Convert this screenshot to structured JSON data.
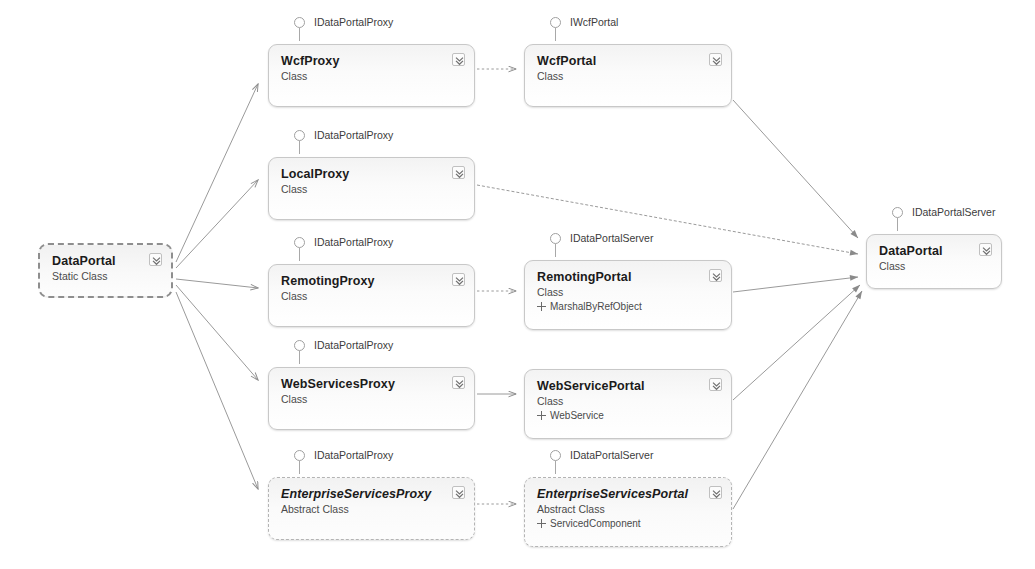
{
  "diagram": {
    "colors": {
      "node_border": "#c8c8c8",
      "node_fill": "#f6f6f6",
      "text": "#1b1b1b",
      "subtext": "#4a4a4a",
      "connector": "#9a9a9a"
    },
    "nodes": [
      {
        "id": "dataportal-client",
        "title": "DataPortal",
        "kind": "Static Class",
        "base": null,
        "interface": null,
        "style": "dashed-strong",
        "italic": false,
        "x": 38,
        "y": 243,
        "w": 135,
        "h": 55
      },
      {
        "id": "wcf-proxy",
        "title": "WcfProxy",
        "kind": "Class",
        "base": null,
        "interface": "IDataPortalProxy",
        "style": "solid",
        "italic": false,
        "x": 268,
        "y": 44,
        "w": 207,
        "h": 63
      },
      {
        "id": "local-proxy",
        "title": "LocalProxy",
        "kind": "Class",
        "base": null,
        "interface": "IDataPortalProxy",
        "style": "solid",
        "italic": false,
        "x": 268,
        "y": 157,
        "w": 207,
        "h": 63
      },
      {
        "id": "remoting-proxy",
        "title": "RemotingProxy",
        "kind": "Class",
        "base": null,
        "interface": "IDataPortalProxy",
        "style": "solid",
        "italic": false,
        "x": 268,
        "y": 264,
        "w": 207,
        "h": 63
      },
      {
        "id": "webservices-proxy",
        "title": "WebServicesProxy",
        "kind": "Class",
        "base": null,
        "interface": "IDataPortalProxy",
        "style": "solid",
        "italic": false,
        "x": 268,
        "y": 367,
        "w": 207,
        "h": 63
      },
      {
        "id": "enterpriseservices-proxy",
        "title": "EnterpriseServicesProxy",
        "kind": "Abstract Class",
        "base": null,
        "interface": "IDataPortalProxy",
        "style": "dashed",
        "italic": true,
        "x": 268,
        "y": 477,
        "w": 207,
        "h": 63
      },
      {
        "id": "wcf-portal",
        "title": "WcfPortal",
        "kind": "Class",
        "base": null,
        "interface": "IWcfPortal",
        "style": "solid",
        "italic": false,
        "x": 524,
        "y": 44,
        "w": 208,
        "h": 63
      },
      {
        "id": "remoting-portal",
        "title": "RemotingPortal",
        "kind": "Class",
        "base": "MarshalByRefObject",
        "interface": "IDataPortalServer",
        "style": "solid",
        "italic": false,
        "x": 524,
        "y": 260,
        "w": 208,
        "h": 70
      },
      {
        "id": "webservice-portal",
        "title": "WebServicePortal",
        "kind": "Class",
        "base": "WebService",
        "interface": null,
        "style": "solid",
        "italic": false,
        "x": 524,
        "y": 369,
        "w": 208,
        "h": 70
      },
      {
        "id": "enterpriseservices-portal",
        "title": "EnterpriseServicesPortal",
        "kind": "Abstract Class",
        "base": "ServicedComponent",
        "interface": "IDataPortalServer",
        "style": "dashed",
        "italic": true,
        "x": 524,
        "y": 477,
        "w": 208,
        "h": 70
      },
      {
        "id": "dataportal-server",
        "title": "DataPortal",
        "kind": "Class",
        "base": null,
        "interface": "IDataPortalServer",
        "style": "solid",
        "italic": false,
        "x": 866,
        "y": 234,
        "w": 136,
        "h": 55
      }
    ],
    "connectors": [
      {
        "id": "c1",
        "from": "dataportal-client",
        "to": "wcf-proxy",
        "style": "solid"
      },
      {
        "id": "c2",
        "from": "dataportal-client",
        "to": "local-proxy",
        "style": "solid"
      },
      {
        "id": "c3",
        "from": "dataportal-client",
        "to": "remoting-proxy",
        "style": "solid"
      },
      {
        "id": "c4",
        "from": "dataportal-client",
        "to": "webservices-proxy",
        "style": "solid"
      },
      {
        "id": "c5",
        "from": "dataportal-client",
        "to": "enterpriseservices-proxy",
        "style": "solid"
      },
      {
        "id": "c6",
        "from": "wcf-proxy",
        "to": "wcf-portal",
        "style": "dashed"
      },
      {
        "id": "c7",
        "from": "remoting-proxy",
        "to": "remoting-portal",
        "style": "dashed"
      },
      {
        "id": "c8",
        "from": "webservices-proxy",
        "to": "webservice-portal",
        "style": "solid"
      },
      {
        "id": "c9",
        "from": "enterpriseservices-proxy",
        "to": "enterpriseservices-portal",
        "style": "dashed"
      },
      {
        "id": "c10",
        "from": "wcf-portal",
        "to": "dataportal-server",
        "style": "solid"
      },
      {
        "id": "c11",
        "from": "local-proxy",
        "to": "dataportal-server",
        "style": "solid"
      },
      {
        "id": "c12",
        "from": "remoting-portal",
        "to": "dataportal-server",
        "style": "solid"
      },
      {
        "id": "c13",
        "from": "webservice-portal",
        "to": "dataportal-server",
        "style": "solid"
      },
      {
        "id": "c14",
        "from": "enterpriseservices-portal",
        "to": "dataportal-server",
        "style": "solid"
      }
    ],
    "icons": {
      "collapse": "chevron-double-down-icon",
      "interface": "lollipop-interface-icon",
      "base": "base-class-icon"
    }
  }
}
